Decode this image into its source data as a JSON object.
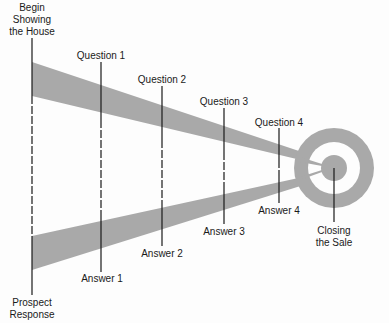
{
  "diagram": {
    "start_label": [
      "Begin",
      "Showing",
      "the House"
    ],
    "end_label": [
      "Prospect",
      "Response"
    ],
    "goal_label": [
      "Closing",
      "the Sale"
    ],
    "questions": [
      {
        "label": "Question 1"
      },
      {
        "label": "Question 2"
      },
      {
        "label": "Question 3"
      },
      {
        "label": "Question 4"
      }
    ],
    "answers": [
      {
        "label": "Answer 1"
      },
      {
        "label": "Answer 2"
      },
      {
        "label": "Answer 3"
      },
      {
        "label": "Answer 4"
      }
    ],
    "colors": {
      "band": "#a9a9a9",
      "target": "#a9a9a9",
      "line": "#1a1a1a",
      "background": "#fdfdfd"
    }
  }
}
